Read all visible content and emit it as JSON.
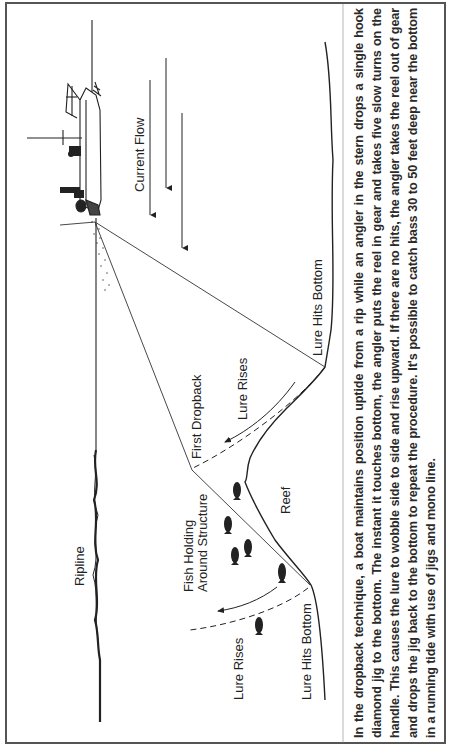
{
  "diagram": {
    "orientation": "rotated 90 degrees counterclockwise",
    "labels": {
      "current_flow": "Current Flow",
      "ripline": "Ripline",
      "lure_hits_bottom_top": "Lure Hits Bottom",
      "lure_rises_top": "Lure Rises",
      "first_dropback": "First Dropback",
      "reef": "Reef",
      "fish_holding_line1": "Fish Holding",
      "fish_holding_line2": "Around Structure",
      "lure_rises_bottom": "Lure Rises",
      "lure_hits_bottom_bottom": "Lure Hits Bottom"
    },
    "elements": [
      "boat",
      "anglers",
      "current-flow-arrows",
      "water-surface",
      "ripline",
      "sea-bottom",
      "reef",
      "fishing-lines",
      "lure-path-arrows",
      "fish"
    ],
    "fish_count": 6,
    "current_arrow_count": 3
  },
  "caption": {
    "text": "In the dropback technique, a boat maintains position uptide from a rip while an angler in the stern drops a single hook diamond jig to the bottom. The instant it touches bottom, the angler puts the reel in gear and takes five slow turns on the handle. This causes the lure to wobble side to side and rise upward. If there are no hits, the angler takes the reel out of gear and drops the jig back to the bottom to repeat the procedure. It's possible to catch bass 30 to 50 feet deep near the bottom in a running tide with use of jigs and mono line."
  },
  "colors": {
    "ink": "#222222",
    "border": "#555555",
    "background": "#ffffff"
  }
}
